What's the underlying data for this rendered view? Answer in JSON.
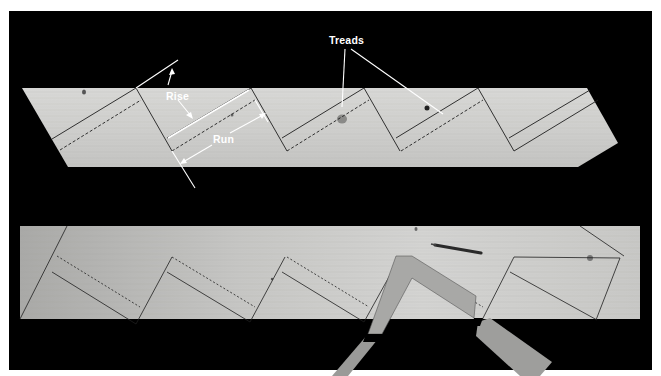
{
  "figure": {
    "colors": {
      "background": "#000000",
      "frame": "#ffffff",
      "wood_light": "#d6d6d4",
      "wood_mid": "#bfbfbd",
      "layout_line": "#1a1a1a",
      "annotation": "#ffffff",
      "square": "#9c9c9a"
    }
  },
  "annotations": {
    "rise": "Rise",
    "run": "Run",
    "treads": "Treads"
  },
  "boards": [
    {
      "name": "top-stringer",
      "steps": 5,
      "annotated": true
    },
    {
      "name": "bottom-stringer",
      "steps": 5,
      "annotated": false,
      "tools": [
        "framing-square",
        "pencil"
      ]
    }
  ]
}
